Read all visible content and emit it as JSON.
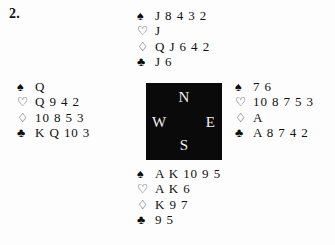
{
  "problem": {
    "number": "2."
  },
  "compass": {
    "north": "N",
    "west": "W",
    "east": "E",
    "south": "S",
    "box_color": "#0a0a0a",
    "label_color": "#f2f2f2"
  },
  "suit_symbols": {
    "spade": "♠",
    "heart": "♡",
    "diamond": "♢",
    "club": "♣"
  },
  "hands": {
    "north": {
      "position_label": "North",
      "spades": "J 8 4 3 2",
      "hearts": "J",
      "diamonds": "Q J 6 4 2",
      "clubs": "J 6"
    },
    "west": {
      "position_label": "West",
      "spades": "Q",
      "hearts": "Q 9 4 2",
      "diamonds": "10 8 5 3",
      "clubs": "K Q 10 3"
    },
    "east": {
      "position_label": "East",
      "spades": "7 6",
      "hearts": "10 8 7 5 3",
      "diamonds": "A",
      "clubs": "A 8 7 4 2"
    },
    "south": {
      "position_label": "South",
      "spades": "A K 10 9 5",
      "hearts": "A K 6",
      "diamonds": "K 9 7",
      "clubs": "9 5"
    }
  }
}
